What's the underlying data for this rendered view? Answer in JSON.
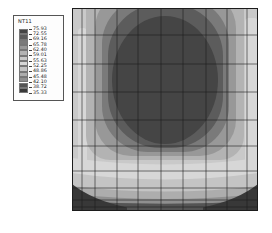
{
  "legend": {
    "title": "NT11",
    "tick_values": [
      "75.93",
      "72.55",
      "69.16",
      "65.78",
      "62.40",
      "59.01",
      "55.63",
      "52.25",
      "48.86",
      "45.48",
      "42.10",
      "38.72",
      "35.33"
    ],
    "swatch_colors": [
      "#454545",
      "#5c5c5c",
      "#7a7a7a",
      "#989898",
      "#b3b3b3",
      "#c9c9c9",
      "#d7d7d7",
      "#c4c4c4",
      "#adadad",
      "#8f8f8f",
      "#545454",
      "#383838"
    ]
  },
  "chart_data": {
    "type": "heatmap",
    "title": "NT11",
    "variable": "NT11",
    "contour_levels": [
      35.33,
      38.72,
      42.1,
      45.48,
      48.86,
      52.25,
      55.63,
      59.01,
      62.4,
      65.78,
      69.16,
      72.55,
      75.93
    ],
    "value_min": 35.33,
    "value_max": 75.93,
    "num_bands": 12,
    "legend_position": "top-left",
    "mesh": "10x10 quadrilateral grid, graded finer toward the side and bottom edges",
    "field_summary": "Temperature contour on a square domain: hottest band (72.55-75.93) forms a large rounded blob at the upper center touching the top edge; bands cool concentrically outward; light mid-value bands run along the left and right edges; nearly horizontal cool bands stack near the bottom; coldest band (35.33-38.72) hugs the bottom edge, thickest at the bottom corners",
    "band_colors_hot_to_cold": [
      "#454545",
      "#5c5c5c",
      "#7a7a7a",
      "#989898",
      "#b3b3b3",
      "#c9c9c9",
      "#d7d7d7",
      "#c4c4c4",
      "#adadad",
      "#8f8f8f",
      "#545454",
      "#383838"
    ]
  },
  "colors": {
    "page_bg": "#ffffff",
    "legend_bg": "#fdfdfd",
    "legend_border": "#555555",
    "mesh_line": "#1c1c1c"
  }
}
